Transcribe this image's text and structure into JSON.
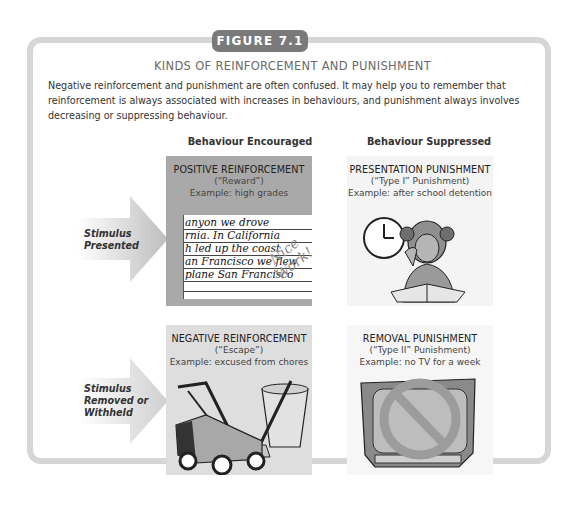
{
  "figure": {
    "tab_label": "FIGURE 7.1",
    "title": "KINDS OF REINFORCEMENT AND PUNISHMENT",
    "intro": "Negative reinforcement and punishment are often confused. It may help you to remember that reinforcement is always associated with increases in behaviours, and punishment always involves decreasing or suppressing behaviour."
  },
  "columns": {
    "encouraged": "Behaviour Encouraged",
    "suppressed": "Behaviour Suppressed"
  },
  "rows": {
    "presented": {
      "line1": "Stimulus",
      "line2": "Presented"
    },
    "removed": {
      "line1": "Stimulus",
      "line2": "Removed or",
      "line3": "Withheld"
    }
  },
  "cards": {
    "positive_reinforcement": {
      "heading": "POSITIVE REINFORCEMENT",
      "nickname": "(“Reward”)",
      "example": "Example: high grades",
      "illustration": "handwritten-paper",
      "handwriting": [
        "anyon we drove",
        "rnia. In California",
        "h led up the coast",
        "an Francisco we flew",
        "plane San Francisco"
      ],
      "stamp": "Nice Work!"
    },
    "presentation_punishment": {
      "heading": "PRESENTATION PUNISHMENT",
      "nickname": "(“Type I” Punishment)",
      "example": "Example: after school detention",
      "illustration": "girl-studying-with-clock"
    },
    "negative_reinforcement": {
      "heading": "NEGATIVE REINFORCEMENT",
      "nickname": "(“Escape”)",
      "example": "Example: excused from chores",
      "illustration": "lawnmower-and-trash-can"
    },
    "removal_punishment": {
      "heading": "REMOVAL PUNISHMENT",
      "nickname": "(“Type II” Punishment)",
      "example": "Example: no TV for a week",
      "illustration": "tv-with-prohibited-sign"
    }
  },
  "colors": {
    "frame": "#d6d6d6",
    "tab": "#7a7a7a",
    "positive_card": "#a9a9a9",
    "negative_card": "#dedede",
    "punishment_card": "#f4f4f4"
  }
}
